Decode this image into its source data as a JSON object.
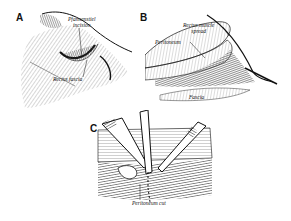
{
  "figure": {
    "panels": [
      {
        "letter": "A",
        "labels": {
          "incision": "Pfannenstiel",
          "incision_2": "incision",
          "fascia": "Rectus fascia"
        }
      },
      {
        "letter": "B",
        "labels": {
          "muscle": "Rectus muscle",
          "muscle_2": "spread",
          "peritoneum": "Peritoneum",
          "fascia": "Fascia"
        }
      },
      {
        "letter": "C",
        "labels": {
          "cut": "Peritoneum cut"
        }
      }
    ],
    "colors": {
      "ink": "#111111",
      "shade": "#9a9a9a",
      "paper": "#ffffff"
    }
  }
}
